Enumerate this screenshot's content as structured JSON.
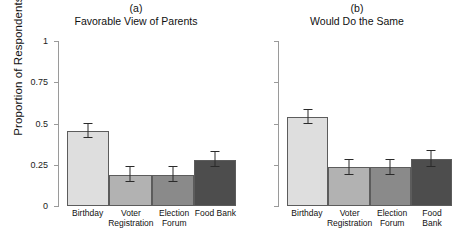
{
  "chart_data": {
    "type": "bar",
    "title": "",
    "xlabel": "",
    "ylabel": "Proportion of Respondents",
    "ylim": [
      0,
      1
    ],
    "ytick_labels": [
      "1",
      "0.75",
      "0.5",
      "0.25",
      "0"
    ],
    "ytick_values": [
      1,
      0.75,
      0.5,
      0.25,
      0
    ],
    "categories": [
      "Birthday",
      "Voter\nRegistration",
      "Election\nForum",
      "Food Bank"
    ],
    "grid": false,
    "legend": "none",
    "bar_colors": [
      "#dedede",
      "#b2b2b2",
      "#8a8a8a",
      "#4d4d4d"
    ],
    "panels": [
      {
        "tag": "(a)",
        "caption": "Favorable View of Parents",
        "values": [
          0.455,
          0.19,
          0.19,
          0.28
        ],
        "errors": [
          0.045,
          0.045,
          0.045,
          0.045
        ]
      },
      {
        "tag": "(b)",
        "caption": "Would Do the Same",
        "values": [
          0.54,
          0.235,
          0.235,
          0.285
        ],
        "errors": [
          0.04,
          0.045,
          0.045,
          0.05
        ]
      }
    ]
  }
}
